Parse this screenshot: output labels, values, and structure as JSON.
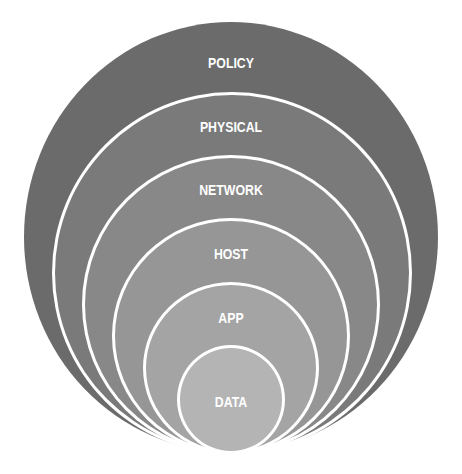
{
  "diagram": {
    "type": "nested-concentric-layers",
    "layers": [
      {
        "label": "POLICY",
        "color": "#6b6b6b"
      },
      {
        "label": "PHYSICAL",
        "color": "#7a7a7a"
      },
      {
        "label": "NETWORK",
        "color": "#888888"
      },
      {
        "label": "HOST",
        "color": "#969696"
      },
      {
        "label": "APP",
        "color": "#a4a4a4"
      },
      {
        "label": "DATA",
        "color": "#b4b4b4"
      }
    ]
  }
}
